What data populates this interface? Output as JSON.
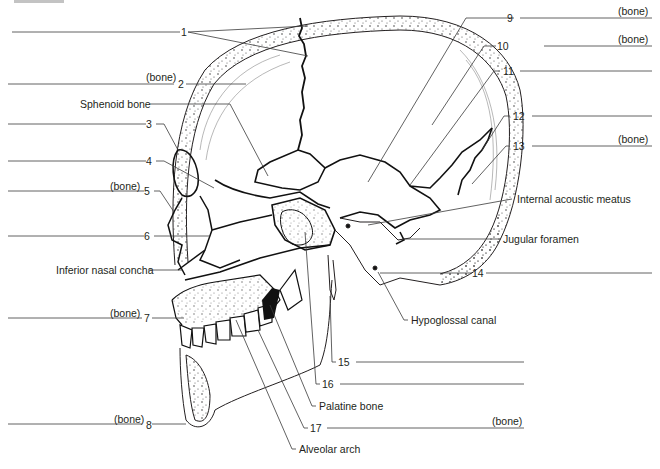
{
  "figure": {
    "caption_fragment": "Figure"
  },
  "numbered_labels": [
    {
      "number": "1",
      "suffix": ""
    },
    {
      "number": "2",
      "suffix": "(bone)"
    },
    {
      "number": "3",
      "suffix": ""
    },
    {
      "number": "4",
      "suffix": ""
    },
    {
      "number": "5",
      "suffix": "(bone)"
    },
    {
      "number": "6",
      "suffix": ""
    },
    {
      "number": "7",
      "suffix": "(bone)"
    },
    {
      "number": "8",
      "suffix": "(bone)"
    },
    {
      "number": "9",
      "suffix": "(bone)"
    },
    {
      "number": "10",
      "suffix": "(bone)"
    },
    {
      "number": "11",
      "suffix": ""
    },
    {
      "number": "12",
      "suffix": ""
    },
    {
      "number": "13",
      "suffix": "(bone)"
    },
    {
      "number": "14",
      "suffix": ""
    },
    {
      "number": "15",
      "suffix": ""
    },
    {
      "number": "16",
      "suffix": ""
    },
    {
      "number": "17",
      "suffix": "(bone)"
    }
  ],
  "named_labels": {
    "sphenoid_bone": "Sphenoid bone",
    "inferior_nasal_concha": "Inferior nasal concha",
    "internal_acoustic_meatus": "Internal acoustic meatus",
    "jugular_foramen": "Jugular foramen",
    "hypoglossal_canal": "Hypoglossal canal",
    "palatine_bone": "Palatine bone",
    "alveolar_arch": "Alveolar arch"
  },
  "colors": {
    "ink": "#231f20",
    "leader": "#3a3a3a",
    "background": "#ffffff",
    "stipple": "#555555"
  }
}
